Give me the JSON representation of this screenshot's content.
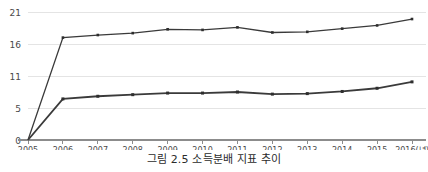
{
  "caption": "그림 2.5 소득분배 지표 추이",
  "chart_data": {
    "type": "line",
    "title": "",
    "subtitle": "",
    "xlabel": "",
    "ylabel": "",
    "x": [
      2005,
      2006,
      2007,
      2008,
      2009,
      2010,
      2011,
      2012,
      2013,
      2014,
      2015,
      2016
    ],
    "categories": [
      "2005",
      "2006",
      "2007",
      "2008",
      "2009",
      "2010",
      "2011",
      "2012",
      "2013",
      "2014",
      "2015",
      "2016(년)"
    ],
    "ytick_labels": [
      "0",
      "5",
      "11",
      "16",
      "21"
    ],
    "ytick_values": [
      0,
      5,
      11,
      16,
      21
    ],
    "ylim": [
      0,
      21
    ],
    "grid": true,
    "legend": "none",
    "series": [
      {
        "name": "upper-series",
        "color": "#3a3a3a",
        "values": [
          0,
          17.0,
          17.4,
          17.7,
          18.3,
          18.2,
          18.6,
          17.8,
          17.9,
          18.4,
          18.9,
          19.9
        ]
      },
      {
        "name": "lower-series",
        "color": "#2e2e2e",
        "values": [
          0,
          6.7,
          7.2,
          7.5,
          7.8,
          7.8,
          8.0,
          7.6,
          7.7,
          8.1,
          8.7,
          9.9
        ]
      }
    ]
  }
}
